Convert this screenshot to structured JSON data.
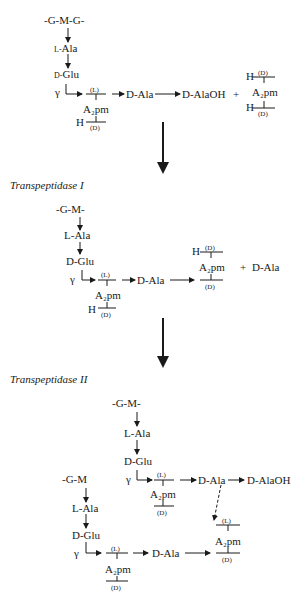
{
  "substrate": {
    "backbone": "-G-M-G-",
    "l_ala": "Ala",
    "l_prefix": "L-",
    "d_glu": "Glu",
    "d_prefix": "D-",
    "gamma": "γ",
    "a2pm": "A₂pm",
    "l_label": "(L)",
    "d_label": "(D)",
    "h": "H",
    "d_ala": "D-Ala",
    "d_alaoh": "D-AlaOH",
    "plus": "+"
  },
  "free_a2pm": {
    "h_top": "H",
    "d_top": "(D)",
    "a2pm": "A₂pm",
    "h_bottom": "H",
    "d_bottom": "(D)"
  },
  "step1": {
    "title": "Transpeptidase I",
    "backbone": "-G-M-",
    "l_ala": "L-Ala",
    "d_glu": "D-Glu",
    "gamma": "γ",
    "a2pm": "A₂pm",
    "l_label": "(L)",
    "d_label": "(D)",
    "h": "H",
    "d_ala": "D-Ala",
    "product_h": "H",
    "product_d_top": "(D)",
    "product_a2pm": "A₂pm",
    "product_d_bottom": "(D)",
    "plus": "+",
    "released": "D-Ala"
  },
  "step2": {
    "title": "Transpeptidase II",
    "chain_a": {
      "backbone": "-G-M-",
      "l_ala": "L-Ala",
      "d_glu": "D-Glu",
      "gamma": "γ",
      "l_label": "(L)",
      "a2pm": "A₂pm",
      "d_label": "(D)",
      "d_ala": "D-Ala",
      "d_alaoh": "D-AlaOH"
    },
    "chain_b": {
      "backbone": "-G-M",
      "l_ala": "L-Ala",
      "d_glu": "D-Glu",
      "gamma": "γ",
      "l_label": "(L)",
      "a2pm": "A₂pm",
      "d_label": "(D)",
      "d_ala": "D-Ala",
      "target_l": "(L)",
      "target_a2pm": "A₂pm",
      "target_d": "(D)"
    }
  }
}
